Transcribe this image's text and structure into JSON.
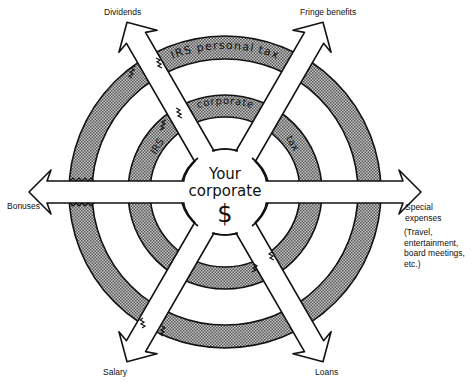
{
  "diagram": {
    "center_label_line1": "Your",
    "center_label_line2": "corporate",
    "center_symbol": "$",
    "outer_ring_label": "IRS personal tax",
    "inner_ring_label_left": "IRS",
    "inner_ring_label_top": "corporate",
    "inner_ring_label_right": "tax",
    "ring_fill_color": "#9a9a9a",
    "line_color": "#111111",
    "arrows": [
      {
        "id": "dividends",
        "label": "Dividends"
      },
      {
        "id": "fringe-benefits",
        "label": "Fringe benefits"
      },
      {
        "id": "bonuses",
        "label": "Bonuses"
      },
      {
        "id": "special-expenses",
        "label": "Special expenses",
        "sublabel_lines": [
          "(Travel,",
          "entertainment,",
          "board meetings,",
          "etc.)"
        ]
      },
      {
        "id": "salary",
        "label": "Salary"
      },
      {
        "id": "loans",
        "label": "Loans"
      }
    ]
  }
}
